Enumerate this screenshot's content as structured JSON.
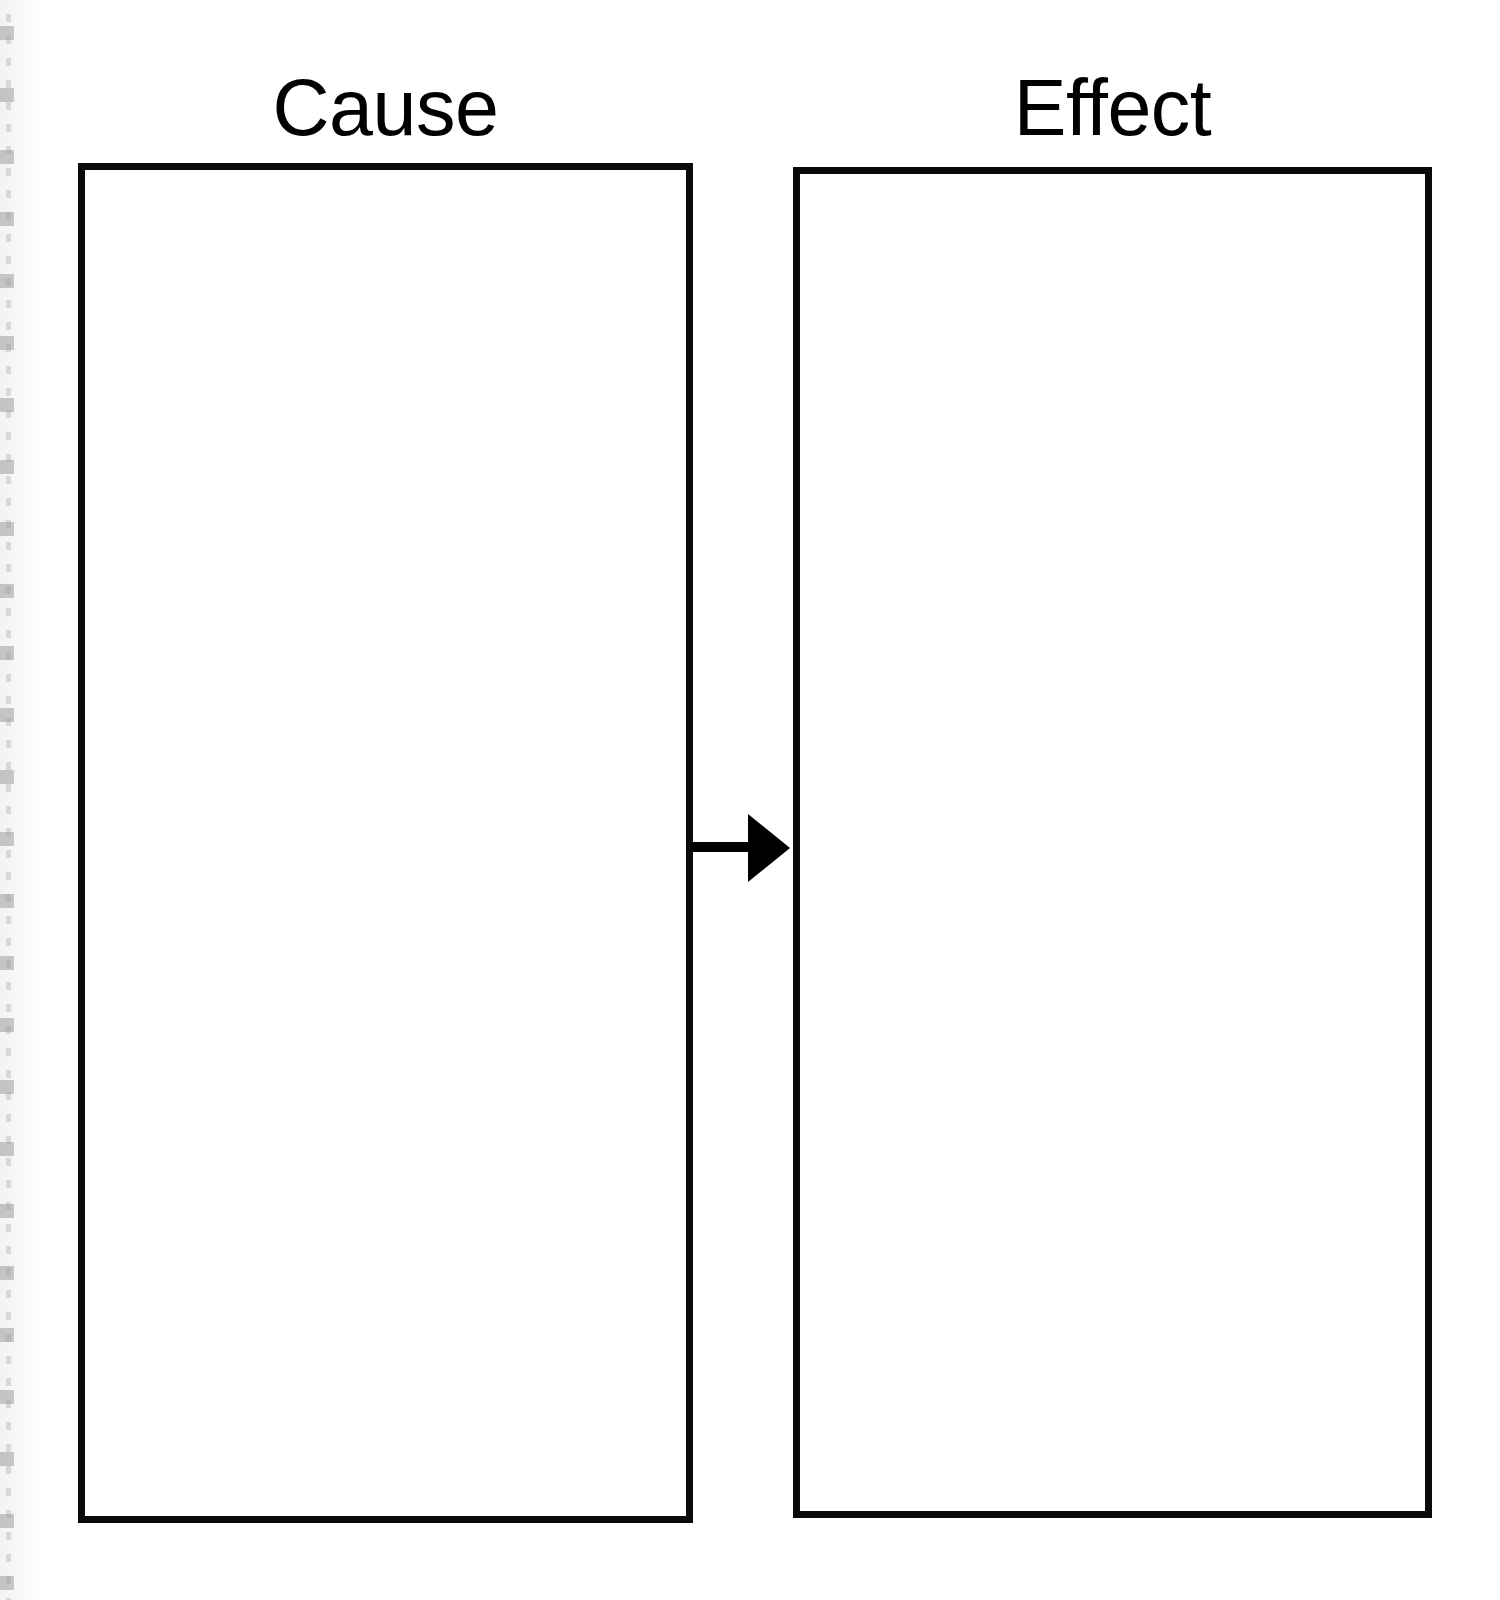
{
  "worksheet": {
    "title": "Cause and Effect graphic organizer",
    "background_color": "#ffffff",
    "ink_color": "#0a0a0a"
  },
  "columns": [
    {
      "id": "cause",
      "heading": "Cause",
      "box_label": "",
      "box_content": "",
      "writing_area": true
    },
    {
      "id": "effect",
      "heading": "Effect",
      "box_label": "",
      "box_content": "",
      "writing_area": true
    }
  ],
  "connector": {
    "icon": "arrow-right-icon",
    "from": "cause",
    "to": "effect",
    "direction": "right",
    "color": "#000000"
  },
  "artifacts": {
    "left_edge": "spiral-binding-scan-marks"
  }
}
